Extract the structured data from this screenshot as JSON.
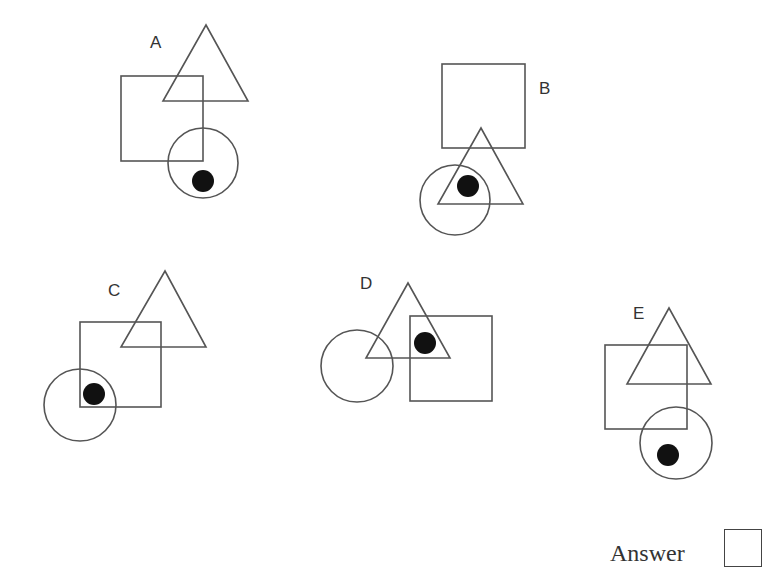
{
  "puzzle": {
    "options": [
      {
        "label": "A",
        "label_pos": [
          150,
          34
        ],
        "square": {
          "x": 121,
          "y": 76,
          "w": 82,
          "h": 85
        },
        "triangle": {
          "apex": [
            206,
            25
          ],
          "base_left": [
            163,
            101
          ],
          "base_right": [
            248,
            101
          ]
        },
        "circle": {
          "cx": 203,
          "cy": 163,
          "r": 35
        },
        "dot": {
          "cx": 203,
          "cy": 181,
          "r": 11
        }
      },
      {
        "label": "B",
        "label_pos": [
          539,
          80
        ],
        "square": {
          "x": 442,
          "y": 64,
          "w": 83,
          "h": 84
        },
        "triangle": {
          "apex": [
            481,
            128
          ],
          "base_left": [
            438,
            204
          ],
          "base_right": [
            523,
            204
          ]
        },
        "circle": {
          "cx": 455,
          "cy": 200,
          "r": 35
        },
        "dot": {
          "cx": 468,
          "cy": 186,
          "r": 11
        }
      },
      {
        "label": "C",
        "label_pos": [
          108,
          282
        ],
        "square": {
          "x": 80,
          "y": 322,
          "w": 81,
          "h": 85
        },
        "triangle": {
          "apex": [
            165,
            271
          ],
          "base_left": [
            121,
            347
          ],
          "base_right": [
            206,
            347
          ]
        },
        "circle": {
          "cx": 80,
          "cy": 405,
          "r": 36
        },
        "dot": {
          "cx": 94,
          "cy": 394,
          "r": 11
        }
      },
      {
        "label": "D",
        "label_pos": [
          360,
          275
        ],
        "square": {
          "x": 410,
          "y": 316,
          "w": 82,
          "h": 85
        },
        "triangle": {
          "apex": [
            408,
            283
          ],
          "base_left": [
            366,
            358
          ],
          "base_right": [
            450,
            358
          ]
        },
        "circle": {
          "cx": 357,
          "cy": 366,
          "r": 36
        },
        "dot": {
          "cx": 425,
          "cy": 343,
          "r": 11
        }
      },
      {
        "label": "E",
        "label_pos": [
          633,
          305
        ],
        "square": {
          "x": 605,
          "y": 345,
          "w": 82,
          "h": 84
        },
        "triangle": {
          "apex": [
            669,
            308
          ],
          "base_left": [
            627,
            384
          ],
          "base_right": [
            711,
            384
          ]
        },
        "circle": {
          "cx": 676,
          "cy": 443,
          "r": 36
        },
        "dot": {
          "cx": 668,
          "cy": 455,
          "r": 11
        }
      }
    ],
    "answer": {
      "label": "Answer",
      "value": ""
    }
  }
}
